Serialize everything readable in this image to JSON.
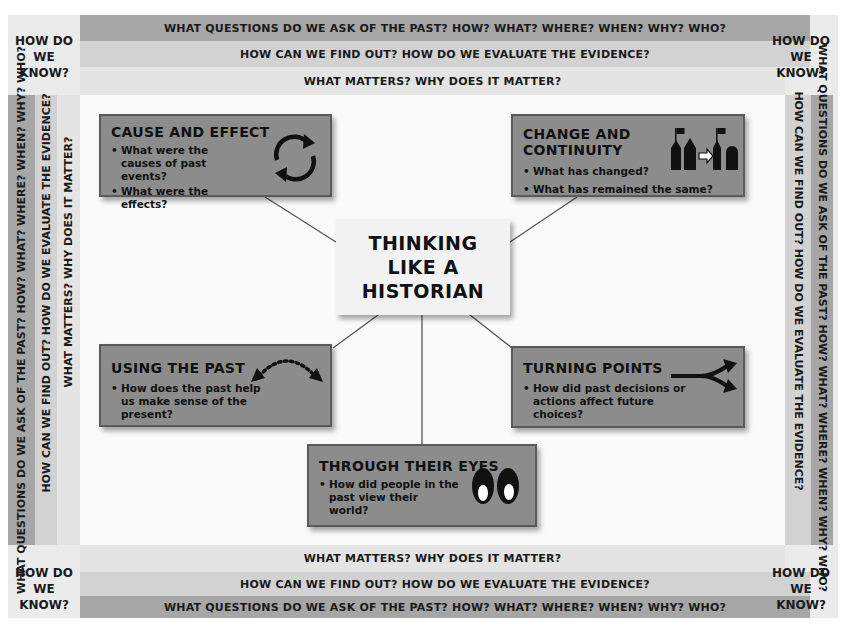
{
  "title": "THINKING LIKE A HISTORIAN",
  "frame": {
    "corner_label": "HOW DO WE KNOW?",
    "corner_lines": [
      "HOW DO",
      "WE KNOW?"
    ],
    "bands": {
      "questions": "WHAT QUESTIONS DO WE ASK OF THE PAST? HOW? WHAT? WHERE? WHEN? WHY? WHO?",
      "evidence": "HOW CAN WE FIND OUT? HOW DO WE EVALUATE THE EVIDENCE?",
      "matters": "WHAT MATTERS? WHY DOES IT MATTER?"
    }
  },
  "cards": [
    {
      "id": "cause-and-effect",
      "title": "CAUSE AND EFFECT",
      "bullets": [
        "What were the causes of past events?",
        "What were the effects?"
      ],
      "icon": "cycle-arrows-icon"
    },
    {
      "id": "change-and-continuity",
      "title": "CHANGE AND CONTINUITY",
      "bullets": [
        "What has changed?",
        "What has remained the same?"
      ],
      "icon": "buildings-change-icon"
    },
    {
      "id": "using-the-past",
      "title": "USING THE PAST",
      "bullets": [
        "How does the past help us make sense of the present?"
      ],
      "icon": "dotted-arc-arrow-icon"
    },
    {
      "id": "turning-points",
      "title": "TURNING POINTS",
      "bullets": [
        "How did past decisions or actions affect future choices?"
      ],
      "icon": "fork-arrow-icon"
    },
    {
      "id": "through-their-eyes",
      "title": "THROUGH THEIR EYES",
      "bullets": [
        "How did people in the past view their world?"
      ],
      "icon": "eyes-icon"
    }
  ],
  "colors": {
    "band_dark": "#a6a6a6",
    "band_mid": "#d2d2d2",
    "band_light": "#e4e4e4",
    "card_fill": "#8c8c8c",
    "card_border": "#5a5a5a",
    "center_fill": "#f2f2f2"
  }
}
